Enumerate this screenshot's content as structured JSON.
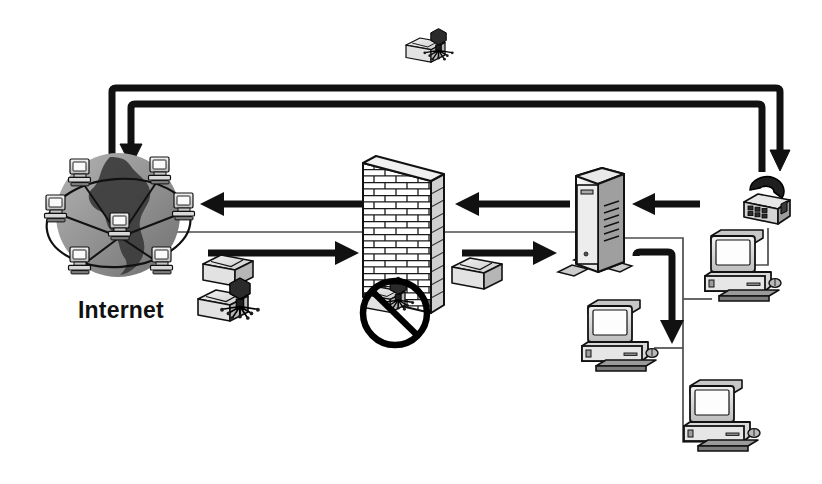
{
  "diagram": {
    "background_color": "#ffffff",
    "ink_color": "#111111",
    "line_color": "#4d4d4d",
    "globe_color": "#9a9a9a",
    "globe_land_color": "#3c3c3c",
    "labels": [
      {
        "id": "internet",
        "text": "Internet",
        "x": 78,
        "y": 300
      }
    ],
    "nodes": [
      {
        "id": "internet-cloud",
        "name": "internet-globe",
        "type": "globe-with-computers",
        "computer_count": 7,
        "x": 118,
        "y": 215
      },
      {
        "id": "firewall",
        "name": "firewall-brick-wall",
        "type": "brick-wall",
        "x": 405,
        "y": 225
      },
      {
        "id": "server",
        "name": "server-tower",
        "type": "tower-server",
        "x": 592,
        "y": 220
      },
      {
        "id": "modem",
        "name": "modem-phone",
        "type": "telephone-modem",
        "x": 768,
        "y": 208
      },
      {
        "id": "pc-right-top",
        "name": "workstation-right-top",
        "type": "desktop-computer",
        "x": 735,
        "y": 255
      },
      {
        "id": "pc-mid",
        "name": "workstation-middle",
        "type": "desktop-computer",
        "x": 612,
        "y": 318
      },
      {
        "id": "pc-bottom",
        "name": "workstation-bottom",
        "type": "desktop-computer",
        "x": 710,
        "y": 388
      }
    ],
    "packets": [
      {
        "id": "packet-clean-left",
        "name": "clean-packet-outbound",
        "infected": false,
        "x": 212,
        "y": 252
      },
      {
        "id": "packet-virus-left",
        "name": "infected-packet-inbound",
        "infected": true,
        "x": 200,
        "y": 285
      },
      {
        "id": "packet-clean-right",
        "name": "clean-packet-inside",
        "infected": false,
        "x": 462,
        "y": 255
      },
      {
        "id": "packet-virus-blocked",
        "name": "blocked-infected-packet",
        "infected": true,
        "blocked": true,
        "x": 375,
        "y": 290
      },
      {
        "id": "packet-virus-top",
        "name": "infected-packet-top",
        "infected": true,
        "x": 412,
        "y": 38
      }
    ],
    "arrows": [
      {
        "id": "arrow-top-outer",
        "name": "rerouted-path-outer",
        "from": "top-right",
        "to": "internet-cloud",
        "direction": "to-internet"
      },
      {
        "id": "arrow-top-inner",
        "name": "rerouted-path-inner",
        "from": "internet-cloud",
        "to": "modem",
        "direction": "to-modem"
      },
      {
        "id": "arrow-in-1",
        "name": "inbound-arrow-firewall-to-internet",
        "direction": "left"
      },
      {
        "id": "arrow-in-2",
        "name": "inbound-arrow-server-to-firewall",
        "direction": "left"
      },
      {
        "id": "arrow-in-3",
        "name": "inbound-arrow-modem-to-server",
        "direction": "left"
      },
      {
        "id": "arrow-out-1",
        "name": "outbound-arrow-internet-to-firewall",
        "direction": "right"
      },
      {
        "id": "arrow-out-2",
        "name": "outbound-arrow-firewall-to-server",
        "direction": "right"
      },
      {
        "id": "arrow-down-lan",
        "name": "traffic-arrow-into-lan",
        "direction": "down"
      }
    ],
    "links": [
      {
        "id": "link-globe-firewall",
        "name": "backbone-line-globe-to-firewall"
      },
      {
        "id": "link-firewall-server",
        "name": "backbone-line-firewall-to-server"
      },
      {
        "id": "link-server-lan",
        "name": "lan-trunk-line"
      },
      {
        "id": "link-modem-pc",
        "name": "modem-to-workstation-line"
      }
    ]
  }
}
